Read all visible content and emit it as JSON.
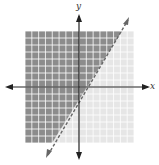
{
  "graph": {
    "x_label": "x",
    "y_label": "y",
    "grid": {
      "min": -8,
      "max": 8,
      "step": 1
    },
    "boundary_line": {
      "slope": 2,
      "intercept": -2,
      "style": "dashed"
    },
    "shaded_region": "above-left of line",
    "colors": {
      "shaded": "#8c8c8c",
      "unshaded": "#e6e6e6",
      "grid_line": "#ffffff",
      "axis": "#222222",
      "boundary": "#666666"
    }
  },
  "chart_data": {
    "type": "line",
    "title": "",
    "xlabel": "x",
    "ylabel": "y",
    "xlim": [
      -8,
      8
    ],
    "ylim": [
      -8,
      8
    ],
    "grid": true,
    "series": [
      {
        "name": "boundary (dashed)",
        "x": [
          -3,
          5
        ],
        "y": [
          -8,
          8
        ]
      }
    ],
    "annotations": [
      "Shaded region: y > 2x - 2 (dashed boundary, strict inequality)"
    ]
  }
}
